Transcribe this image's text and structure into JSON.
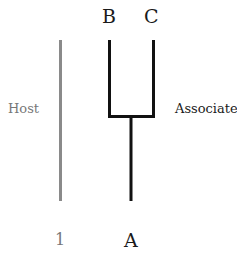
{
  "diagram": {
    "host": {
      "label": "Host",
      "taxon": "1",
      "color": "#8a8a8a"
    },
    "associate": {
      "label": "Associate",
      "root": "A",
      "tips": [
        "B",
        "C"
      ],
      "color": "#111111"
    }
  }
}
